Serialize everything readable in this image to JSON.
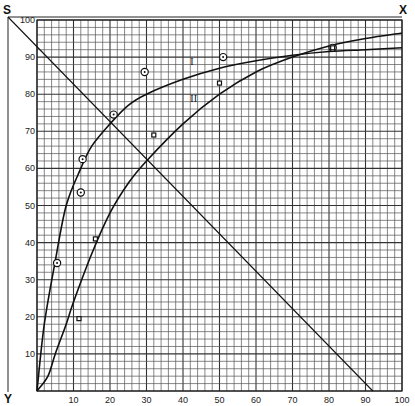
{
  "chart_data": {
    "type": "line",
    "title": "",
    "xlabel": "",
    "ylabel": "",
    "xlim": [
      0,
      100
    ],
    "ylim": [
      0,
      100
    ],
    "grid": true,
    "grid_minor_step": 2,
    "grid_major_step": 10,
    "x_ticks": [
      "10",
      "20",
      "30",
      "40",
      "50",
      "60",
      "70",
      "80",
      "90",
      "100"
    ],
    "y_ticks": [
      "10",
      "20",
      "30",
      "40",
      "50",
      "60",
      "70",
      "80",
      "90",
      "100"
    ],
    "corner_labels": {
      "top_left": "S",
      "top_right": "X",
      "bottom_left": "Y"
    },
    "series": [
      {
        "name": "I",
        "kind": "curve",
        "x": [
          0,
          2,
          5,
          8,
          12,
          15,
          20,
          25,
          30,
          40,
          50,
          60,
          70,
          80,
          90,
          100
        ],
        "y": [
          0,
          18,
          35,
          50,
          60,
          66,
          72,
          77,
          80,
          84,
          87,
          89,
          90.5,
          91.5,
          92,
          92.5
        ]
      },
      {
        "name": "II",
        "kind": "curve",
        "x": [
          0,
          3,
          5,
          8,
          10,
          15,
          20,
          25,
          30,
          40,
          50,
          60,
          70,
          80,
          90,
          100
        ],
        "y": [
          0,
          4,
          10,
          18,
          24,
          37,
          48,
          56,
          62,
          72,
          80,
          86,
          90,
          93,
          95,
          96.5
        ]
      },
      {
        "name": "diagonal",
        "kind": "line",
        "x": [
          -8,
          92
        ],
        "y": [
          100,
          0
        ]
      },
      {
        "name": "circle points",
        "kind": "scatter",
        "marker": "circle",
        "x": [
          5.5,
          12,
          12.5,
          21,
          29.5,
          51
        ],
        "y": [
          34.5,
          53.5,
          62.5,
          74.5,
          86,
          90
        ]
      },
      {
        "name": "square points",
        "kind": "scatter",
        "marker": "square",
        "x": [
          11.5,
          16,
          32,
          50
        ],
        "y": [
          19.5,
          41,
          69,
          83
        ]
      },
      {
        "name": "combined point",
        "kind": "scatter",
        "marker": "circled-square",
        "x": [
          81
        ],
        "y": [
          92.5
        ]
      }
    ],
    "curve_labels": [
      {
        "text": "I",
        "x": 42,
        "y": 88
      },
      {
        "text": "II",
        "x": 42,
        "y": 78
      }
    ]
  }
}
